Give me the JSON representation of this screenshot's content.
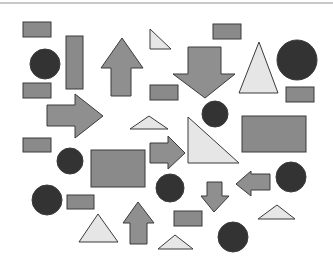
{
  "colors": {
    "rect_fill": "#8a8a8a",
    "arrow_fill": "#8f8f8f",
    "circle_fill": "#333333",
    "triangle_fill": "#e6e6e6",
    "stroke": "#3a3a3a",
    "topline": "#c8c8c8"
  },
  "shapes": {
    "rectangles": [
      {
        "x": 23,
        "y": 22,
        "w": 28,
        "h": 15
      },
      {
        "x": 66,
        "y": 36,
        "w": 17,
        "h": 53
      },
      {
        "x": 23,
        "y": 83,
        "w": 28,
        "h": 15
      },
      {
        "x": 213,
        "y": 24,
        "w": 28,
        "h": 15
      },
      {
        "x": 150,
        "y": 85,
        "w": 28,
        "h": 15
      },
      {
        "x": 286,
        "y": 87,
        "w": 28,
        "h": 15
      },
      {
        "x": 242,
        "y": 116,
        "w": 64,
        "h": 36
      },
      {
        "x": 23,
        "y": 138,
        "w": 28,
        "h": 14
      },
      {
        "x": 91,
        "y": 150,
        "w": 54,
        "h": 37
      },
      {
        "x": 67,
        "y": 195,
        "w": 27,
        "h": 14
      },
      {
        "x": 174,
        "y": 211,
        "w": 28,
        "h": 15
      }
    ],
    "circles": [
      {
        "cx": 45,
        "cy": 64,
        "r": 15
      },
      {
        "cx": 297,
        "cy": 60,
        "r": 20
      },
      {
        "cx": 215,
        "cy": 114,
        "r": 13
      },
      {
        "cx": 70,
        "cy": 161,
        "r": 13
      },
      {
        "cx": 170,
        "cy": 188,
        "r": 14
      },
      {
        "cx": 291,
        "cy": 177,
        "r": 15
      },
      {
        "cx": 47,
        "cy": 200,
        "r": 15
      },
      {
        "cx": 233,
        "cy": 237,
        "r": 15
      }
    ],
    "triangles": [
      {
        "points": "150,29 150,49 171,49"
      },
      {
        "points": "239,93 278,93 259,42"
      },
      {
        "points": "130,129 168,129 149,116"
      },
      {
        "points": "188,117 188,163 239,163"
      },
      {
        "points": "258,219 295,219 277,205"
      },
      {
        "points": "79,242 118,242 98,214"
      },
      {
        "points": "158,249 193,249 175,235"
      }
    ],
    "arrows": [
      {
        "dir": "up",
        "points": "111,96 131,96 131,68 143,68 122,38 101,68 111,68"
      },
      {
        "dir": "down",
        "points": "188,47 221,47 221,74 235,74 205,98 173,74 188,74"
      },
      {
        "dir": "right",
        "points": "47,105 75,105 75,94 103,116 75,138 75,126 47,126"
      },
      {
        "dir": "right",
        "points": "150,143 168,143 168,136 185,153 168,169 168,163 150,163"
      },
      {
        "dir": "left",
        "points": "270,174 270,190 251,190 251,196 236,184 251,171 251,174"
      },
      {
        "dir": "down",
        "points": "207,182 222,182 222,196 229,196 214,212 201,196 207,196"
      },
      {
        "dir": "up",
        "points": "130,244 147,244 147,223 154,223 138,202 123,223 130,223"
      }
    ]
  }
}
